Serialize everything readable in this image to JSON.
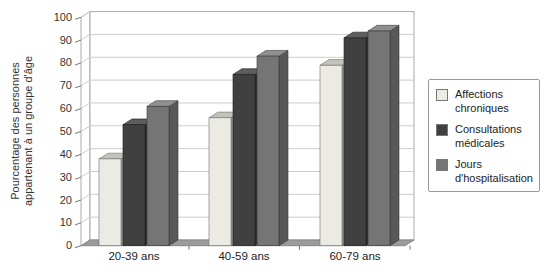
{
  "chart_data": {
    "type": "bar",
    "projection": "3d",
    "title": "",
    "xlabel": "",
    "ylabel": "Pourcentage des personnes appartenant à un groupe d'âge",
    "ylabel_lines": [
      "Pourcentage des personnes",
      "appartenant à un groupe d'âge"
    ],
    "categories": [
      "20-39 ans",
      "40-59 ans",
      "60-79 ans"
    ],
    "series": [
      {
        "name": "Affections chroniques",
        "values": [
          38,
          56,
          79
        ],
        "color_front": "#ebebe4",
        "color_top": "#c3c3bb",
        "color_side": "#9d9d97",
        "color_edge": "#6f6f6f"
      },
      {
        "name": "Consultations médicales",
        "values": [
          53,
          75,
          91
        ],
        "color_front": "#404040",
        "color_top": "#5d5d5d",
        "color_side": "#2d2d2d",
        "color_edge": "#1e1e1e"
      },
      {
        "name": "Jours d'hospitalisation",
        "values": [
          61,
          83,
          94
        ],
        "color_front": "#757575",
        "color_top": "#909090",
        "color_side": "#585858",
        "color_edge": "#3a3a3a"
      }
    ],
    "ylim": [
      0,
      100
    ],
    "yticks": [
      0,
      10,
      20,
      30,
      40,
      50,
      60,
      70,
      80,
      90,
      100
    ],
    "grid": true,
    "legend_position": "right",
    "colors": {
      "gridline": "#cccccc",
      "wall_border": "#aaaaaa",
      "floor": "#9b9b9b",
      "floor_edge": "#878787",
      "tick": "#777777",
      "tick_text": "#333333",
      "category_text": "#222222",
      "background": "#ffffff"
    }
  }
}
